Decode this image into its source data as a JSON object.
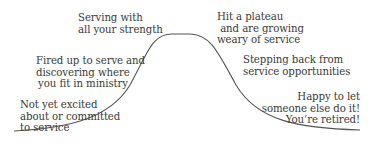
{
  "diagram": {
    "type": "bell-curve",
    "stroke_color": "#555555",
    "text_color": "#3a3a3a",
    "stages": [
      {
        "id": "not-excited",
        "text": "Not yet excited\nabout or committed\nto service"
      },
      {
        "id": "fired-up",
        "text": "Fired up to serve and\ndiscovering where\nyou fit in ministry"
      },
      {
        "id": "serving-strength",
        "text": "Serving with\nall your strength"
      },
      {
        "id": "plateau",
        "text": "Hit a plateau\n and are growing\nweary of service"
      },
      {
        "id": "stepping-back",
        "text": "Stepping back from\nservice opportunities"
      },
      {
        "id": "retired",
        "text": "Happy to let\nsomeone else do it!\nYou’re retired!"
      }
    ]
  }
}
